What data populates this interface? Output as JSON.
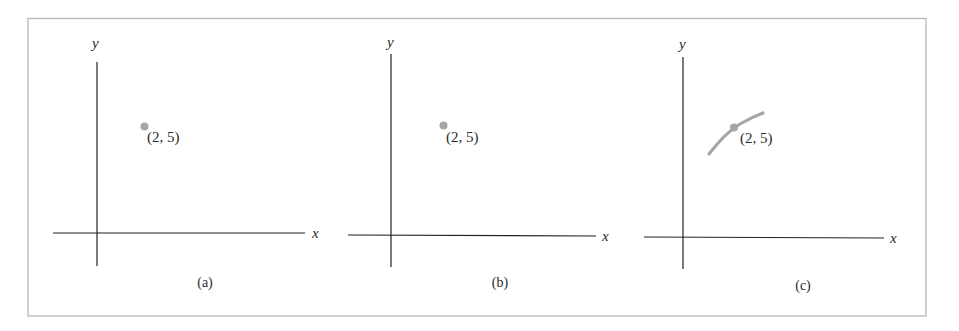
{
  "figure": {
    "frame_color": "#b8b8b8",
    "point_color": "#a6a6a6",
    "axis_color": "#222222",
    "panels": [
      {
        "id": "a",
        "caption": "(a)",
        "x_axis_label": "x",
        "y_axis_label": "y",
        "point_label": "(2, 5)",
        "content": "isolated point"
      },
      {
        "id": "b",
        "caption": "(b)",
        "x_axis_label": "x",
        "y_axis_label": "y",
        "point_label": "(2, 5)",
        "content": "isolated point"
      },
      {
        "id": "c",
        "caption": "(c)",
        "x_axis_label": "x",
        "y_axis_label": "y",
        "point_label": "(2, 5)",
        "content": "point on short curve segment"
      }
    ]
  }
}
